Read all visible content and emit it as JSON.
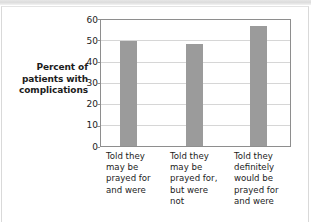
{
  "chart_data": {
    "type": "bar",
    "title": "",
    "xlabel": "",
    "ylabel": "Percent of patients with complications",
    "ylabel_lines": [
      "Percent of",
      "patients with",
      "complications"
    ],
    "categories": [
      "Told they may be prayed for and were",
      "Told they may be prayed for, but were not",
      "Told they definitely would be prayed for and were"
    ],
    "category_lines": [
      [
        "Told they",
        "may be",
        "prayed for",
        "and were"
      ],
      [
        "Told they",
        "may be",
        "prayed for,",
        "but were",
        "not"
      ],
      [
        "Told they",
        "definitely",
        "would be",
        "prayed for",
        "and were"
      ]
    ],
    "values": [
      50,
      48.8,
      57
    ],
    "ylim": [
      0,
      60
    ],
    "ytick_values": [
      0,
      10,
      20,
      30,
      40,
      50,
      60
    ],
    "ytick_labels": [
      "0",
      "10",
      "20",
      "30",
      "40",
      "50",
      "60"
    ],
    "grid": true,
    "legend": "none",
    "bar_color": "#9b9b9b",
    "axis_color": "#8e8e8e",
    "gridline_color": "#d6d6d6",
    "text_color": "#1c1c1c",
    "background_color": "#ffffff"
  }
}
